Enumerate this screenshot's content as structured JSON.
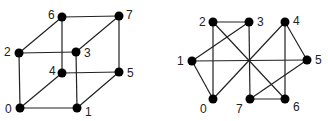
{
  "graphs": [
    {
      "name": "cube-graph",
      "nodes": [
        {
          "id": "0",
          "x": 20,
          "y": 108,
          "lx": 5,
          "ly": 113
        },
        {
          "id": "1",
          "x": 77,
          "y": 108,
          "lx": 85,
          "ly": 116
        },
        {
          "id": "2",
          "x": 19,
          "y": 53,
          "lx": 4,
          "ly": 56
        },
        {
          "id": "3",
          "x": 76,
          "y": 52,
          "lx": 84,
          "ly": 57
        },
        {
          "id": "4",
          "x": 62,
          "y": 73,
          "lx": 49,
          "ly": 75
        },
        {
          "id": "5",
          "x": 119,
          "y": 72,
          "lx": 127,
          "ly": 77
        },
        {
          "id": "6",
          "x": 62,
          "y": 17,
          "lx": 48,
          "ly": 19
        },
        {
          "id": "7",
          "x": 119,
          "y": 16,
          "lx": 126,
          "ly": 19
        }
      ],
      "edges": [
        [
          "0",
          "1"
        ],
        [
          "0",
          "2"
        ],
        [
          "0",
          "4"
        ],
        [
          "1",
          "3"
        ],
        [
          "1",
          "5"
        ],
        [
          "2",
          "3"
        ],
        [
          "2",
          "6"
        ],
        [
          "3",
          "7"
        ],
        [
          "4",
          "5"
        ],
        [
          "4",
          "6"
        ],
        [
          "5",
          "7"
        ],
        [
          "6",
          "7"
        ]
      ]
    },
    {
      "name": "isomorphic-graph",
      "nodes": [
        {
          "id": "0",
          "x": 213,
          "y": 99,
          "lx": 200,
          "ly": 113
        },
        {
          "id": "1",
          "x": 192,
          "y": 61,
          "lx": 177,
          "ly": 65
        },
        {
          "id": "2",
          "x": 213,
          "y": 22,
          "lx": 199,
          "ly": 26
        },
        {
          "id": "3",
          "x": 249,
          "y": 22,
          "lx": 257,
          "ly": 26
        },
        {
          "id": "4",
          "x": 285,
          "y": 22,
          "lx": 293,
          "ly": 25
        },
        {
          "id": "5",
          "x": 307,
          "y": 60,
          "lx": 315,
          "ly": 64
        },
        {
          "id": "6",
          "x": 285,
          "y": 99,
          "lx": 293,
          "ly": 111
        },
        {
          "id": "7",
          "x": 250,
          "y": 99,
          "lx": 236,
          "ly": 113
        }
      ],
      "edges": [
        [
          "2",
          "3"
        ],
        [
          "2",
          "0"
        ],
        [
          "2",
          "6"
        ],
        [
          "3",
          "1"
        ],
        [
          "3",
          "7"
        ],
        [
          "1",
          "0"
        ],
        [
          "1",
          "5"
        ],
        [
          "0",
          "4"
        ],
        [
          "4",
          "5"
        ],
        [
          "4",
          "6"
        ],
        [
          "5",
          "7"
        ],
        [
          "7",
          "6"
        ]
      ]
    }
  ]
}
